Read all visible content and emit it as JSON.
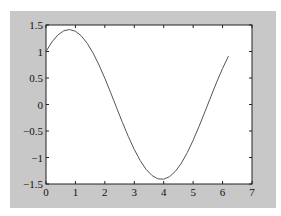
{
  "chart_data": {
    "type": "line",
    "title": "",
    "xlabel": "",
    "ylabel": "",
    "xlim": [
      0,
      7
    ],
    "ylim": [
      -1.5,
      1.5
    ],
    "grid": false,
    "legend": null,
    "xticks": [
      "0",
      "1",
      "2",
      "3",
      "4",
      "5",
      "6",
      "7"
    ],
    "yticks": [
      "1.5",
      "1",
      "0.5",
      "0",
      "-0.5",
      "-1",
      "-1.5"
    ],
    "series": [
      {
        "name": "sin(x)+cos(x)",
        "color": "#555555",
        "x": [
          0,
          0.2,
          0.4,
          0.6,
          0.8,
          1.0,
          1.2,
          1.4,
          1.6,
          1.8,
          2.0,
          2.2,
          2.4,
          2.6,
          2.8,
          3.0,
          3.2,
          3.4,
          3.6,
          3.8,
          4.0,
          4.2,
          4.4,
          4.6,
          4.8,
          5.0,
          5.2,
          5.4,
          5.6,
          5.8,
          6.0,
          6.2
        ],
        "y": [
          1.0,
          1.179,
          1.31,
          1.39,
          1.414,
          1.382,
          1.295,
          1.155,
          0.971,
          0.747,
          0.493,
          0.22,
          -0.062,
          -0.342,
          -0.607,
          -0.849,
          -1.057,
          -1.222,
          -1.339,
          -1.402,
          -1.41,
          -1.361,
          -1.259,
          -1.106,
          -0.909,
          -0.675,
          -0.415,
          -0.138,
          0.144,
          0.423,
          0.681,
          0.913
        ]
      }
    ]
  },
  "figure": {
    "background": "#c8c8c8",
    "axes_background": "#ffffff"
  }
}
